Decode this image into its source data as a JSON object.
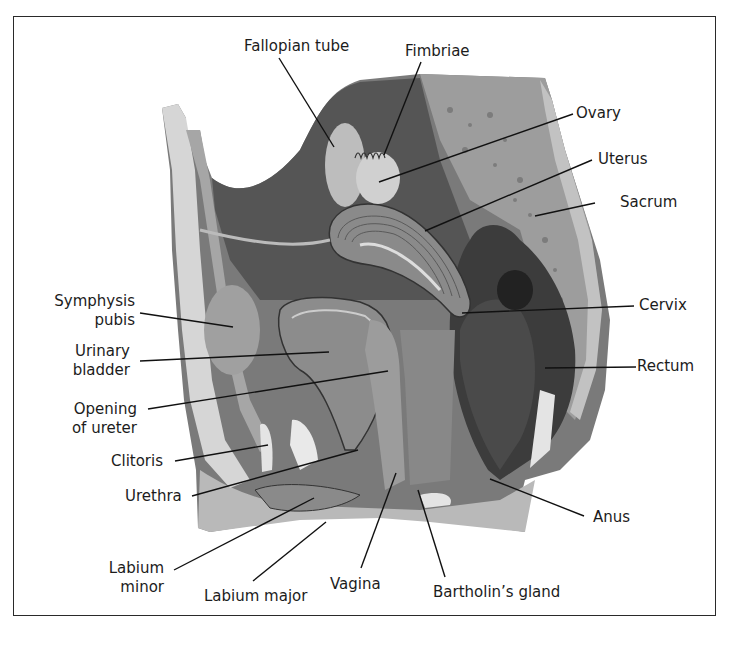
{
  "figure": {
    "colors": {
      "background": "#ffffff",
      "frame": "#2a2a2a",
      "cavity": "#5a5a5a",
      "tissue_light": "#bdbdbd",
      "tissue_mid": "#8f8f8f",
      "bone": "#a8a8a8",
      "rectum": "#3e3e3e",
      "skin": "#c9c9c9",
      "fat": "#e6e6e6",
      "leader_line": "#111111"
    }
  },
  "labels": {
    "fallopian_tube": "Fallopian tube",
    "fimbriae": "Fimbriae",
    "ovary": "Ovary",
    "uterus": "Uterus",
    "sacrum": "Sacrum",
    "cervix": "Cervix",
    "rectum": "Rectum",
    "anus": "Anus",
    "symphysis_pubis_1": "Symphysis",
    "symphysis_pubis_2": "pubis",
    "urinary_bladder_1": "Urinary",
    "urinary_bladder_2": "bladder",
    "opening_of_ureter_1": "Opening",
    "opening_of_ureter_2": "of ureter",
    "clitoris": "Clitoris",
    "urethra": "Urethra",
    "labium_minor_1": "Labium",
    "labium_minor_2": "minor",
    "labium_major": "Labium major",
    "vagina": "Vagina",
    "bartholins_gland": "Bartholin’s gland"
  }
}
